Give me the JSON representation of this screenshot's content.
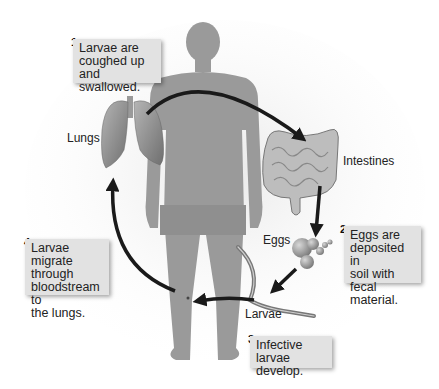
{
  "labels": {
    "lungs": "Lungs",
    "intestines": "Intestines",
    "eggs": "Eggs",
    "larvae": "Larvae"
  },
  "steps": [
    {
      "number": "1",
      "text": "Larvae are coughed up and swallowed.",
      "lines": [
        "Larvae are",
        "coughed up and",
        "swallowed."
      ]
    },
    {
      "number": "2",
      "text": "Eggs are deposited in soil with fecal material.",
      "lines": [
        "Eggs are",
        "deposited in",
        "soil with fecal",
        "material."
      ]
    },
    {
      "number": "3",
      "text": "Infective larvae develop.",
      "lines": [
        "Infective larvae",
        "develop."
      ]
    },
    {
      "number": "4",
      "text": "Larvae migrate through bloodstream to the lungs.",
      "lines": [
        "Larvae migrate",
        "through",
        "bloodstream to",
        "the lungs."
      ]
    }
  ],
  "colors": {
    "silhouette": "#9a9a9a",
    "arrow": "#1a1a1a",
    "callout_bg": "#e2e2e2",
    "organ": "#8c8c8c"
  }
}
